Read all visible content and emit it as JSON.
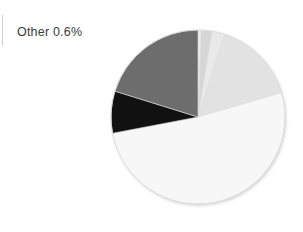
{
  "figure": {
    "background_color": "#ffffff",
    "width": 303,
    "height": 232
  },
  "callout": {
    "label": "Other 0.6%",
    "text_color": "#3a3a3a",
    "tick_color": "#cfcfcf",
    "tick_name": "leader-line"
  },
  "chart_data": {
    "type": "pie",
    "title": "",
    "xlabel": "",
    "ylabel": "",
    "grid": false,
    "legend": "none",
    "start_angle_deg": 0,
    "direction": "clockwise",
    "center": {
      "x": 198,
      "y": 117
    },
    "radius": 88,
    "labels": [
      "Other 0.6%"
    ],
    "annotations": [
      {
        "text": "Other 0.6%",
        "slice_index": 0,
        "position": "outside-left"
      }
    ],
    "categories": [
      "Slice 1",
      "Slice 2",
      "Slice 3",
      "Slice 4",
      "Slice 5",
      "Slice 6",
      "Slice 7"
    ],
    "values": [
      0.6,
      2.0,
      2.4,
      15.5,
      51.5,
      7.8,
      20.2
    ],
    "unit": "%",
    "angles_deg": [
      2.2,
      7.2,
      8.6,
      55.8,
      185.4,
      28.1,
      72.7
    ],
    "colors": [
      "#ebebeb",
      "#d6d6d6",
      "#e9e9e9",
      "#e2e2e2",
      "#f7f7f7",
      "#111111",
      "#6d6d6d"
    ],
    "slices": [
      {
        "name": "Slice 1",
        "value": 0.6,
        "color": "#ebebeb",
        "start_deg": 0.0,
        "end_deg": 2.2
      },
      {
        "name": "Slice 2",
        "value": 2.0,
        "color": "#d6d6d6",
        "start_deg": 2.2,
        "end_deg": 9.4
      },
      {
        "name": "Slice 3",
        "value": 2.4,
        "color": "#e9e9e9",
        "start_deg": 9.4,
        "end_deg": 18.0
      },
      {
        "name": "Slice 4",
        "value": 15.5,
        "color": "#e2e2e2",
        "start_deg": 18.0,
        "end_deg": 73.8
      },
      {
        "name": "Slice 5",
        "value": 51.5,
        "color": "#f7f7f7",
        "start_deg": 73.8,
        "end_deg": 259.2
      },
      {
        "name": "Slice 6",
        "value": 7.8,
        "color": "#111111",
        "start_deg": 259.2,
        "end_deg": 287.3
      },
      {
        "name": "Slice 7",
        "value": 20.2,
        "color": "#6d6d6d",
        "start_deg": 287.3,
        "end_deg": 360.0
      }
    ],
    "edge_color": "#dcdcdc",
    "edge_width": 0.6
  }
}
